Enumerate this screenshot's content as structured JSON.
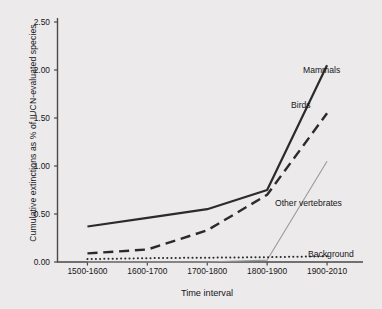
{
  "chart_data": {
    "type": "line",
    "title": "",
    "xlabel": "Time interval",
    "ylabel": "Cumulative extinctions as % of IUCN-evaluated species",
    "categories": [
      "1500-1600",
      "1600-1700",
      "1700-1800",
      "1800-1900",
      "1900-2010"
    ],
    "ylim": [
      0.0,
      2.5
    ],
    "yticks": [
      "0.00",
      "0.50",
      "1.00",
      "1.50",
      "2.00",
      "2.50"
    ],
    "ytick_values": [
      0.0,
      0.5,
      1.0,
      1.5,
      2.0,
      2.5
    ],
    "grid": false,
    "legend_position": "inline-annotations",
    "series": [
      {
        "name": "Mammals",
        "style": "solid",
        "color": "#2b2b2b",
        "width": 2.2,
        "values": [
          0.37,
          0.46,
          0.55,
          0.75,
          2.05
        ]
      },
      {
        "name": "Birds",
        "style": "dashed",
        "color": "#2b2b2b",
        "width": 2.4,
        "values": [
          0.09,
          0.13,
          0.33,
          0.7,
          1.55
        ]
      },
      {
        "name": "Other vertebrates",
        "style": "solid",
        "color": "#9a9a9a",
        "width": 1.1,
        "values": [
          0.0,
          0.0,
          0.0,
          0.02,
          1.05
        ]
      },
      {
        "name": "Background",
        "style": "dotted",
        "color": "#2b2b2b",
        "width": 2.0,
        "values": [
          0.03,
          0.04,
          0.045,
          0.05,
          0.06
        ]
      }
    ],
    "annotations": [
      {
        "text": "Mammals",
        "series": "Mammals"
      },
      {
        "text": "Birds",
        "series": "Birds"
      },
      {
        "text": "Other vertebrates",
        "series": "Other vertebrates"
      },
      {
        "text": "Background",
        "series": "Background"
      }
    ]
  }
}
